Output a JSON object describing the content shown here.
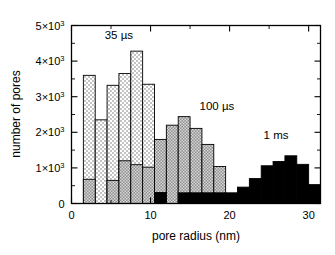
{
  "chart_data": {
    "type": "bar",
    "title": "",
    "subtitle": "",
    "xlabel": "pore radius (nm)",
    "ylabel": "number of pores",
    "xlim": [
      0,
      31.5
    ],
    "ylim": [
      0,
      5000
    ],
    "grid": false,
    "legend_position": "inline-annotations",
    "xticks": [
      0,
      10,
      20,
      30
    ],
    "xticklabels": [
      "0",
      "10",
      "20",
      "30"
    ],
    "xtick_minor": [
      5,
      15,
      25
    ],
    "yticks": [
      0,
      1000,
      2000,
      3000,
      4000,
      5000
    ],
    "yticklabels": [
      "0",
      "1×10³",
      "2×10³",
      "3×10³",
      "4×10³",
      "5×10³"
    ],
    "ytick_minor": [
      500,
      1500,
      2500,
      3500,
      4500
    ],
    "bin_width": 1.5,
    "series": [
      {
        "name": "35 µs",
        "fill": "dotted-white",
        "color": "#ffffff",
        "bin_starts": [
          1.5,
          3.0,
          4.5,
          6.0,
          7.5,
          9.0
        ],
        "values": [
          3600,
          2350,
          3320,
          3650,
          4280,
          3350
        ]
      },
      {
        "name": "100 µs",
        "fill": "checker-gray",
        "color": "#9a9a9a",
        "bin_starts": [
          1.5,
          4.5,
          6.0,
          7.5,
          9.0,
          10.5,
          12.0,
          13.5,
          15.0,
          16.5,
          18.0
        ],
        "values": [
          680,
          650,
          1200,
          1090,
          1020,
          1800,
          2200,
          2440,
          2110,
          1660,
          1040
        ]
      },
      {
        "name": "1 ms",
        "fill": "solid-black",
        "color": "#000000",
        "bin_starts": [
          10.5,
          12.0,
          13.5,
          15.0,
          16.5,
          18.0,
          19.5,
          21.0,
          22.5,
          24.0,
          25.5,
          27.0,
          28.5,
          30.0
        ],
        "values": [
          310,
          0,
          300,
          300,
          300,
          300,
          300,
          460,
          700,
          1060,
          1180,
          1340,
          1100,
          530
        ]
      }
    ],
    "annotations": [
      {
        "text": "35 µs",
        "x": 4.2,
        "y": 4620
      },
      {
        "text": "100 µs",
        "x": 16.2,
        "y": 2640
      },
      {
        "text": "1 ms",
        "x": 24.3,
        "y": 1800
      }
    ]
  },
  "axes": {
    "y_axis_label": "number of pores",
    "x_axis_label": "pore radius (nm)"
  }
}
